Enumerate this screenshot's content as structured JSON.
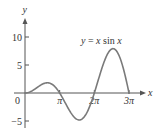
{
  "chart_data": {
    "type": "line",
    "title": "",
    "annotation": "y = x sin x",
    "annotation_parts": {
      "lhs": "y",
      "eq": " = ",
      "x": "x",
      "fn": " sin ",
      "arg": "x"
    },
    "xlabel": "x",
    "ylabel": "y",
    "xlim": [
      0,
      9.8
    ],
    "ylim": [
      -6,
      12.9
    ],
    "grid": false,
    "legend": "none",
    "x_ticks": [
      {
        "value": 3.14159,
        "label": "π"
      },
      {
        "value": 6.28319,
        "label": "2π"
      },
      {
        "value": 9.42478,
        "label": "3π"
      }
    ],
    "y_ticks": [
      {
        "value": 10,
        "label": "10"
      },
      {
        "value": 5,
        "label": "5"
      },
      {
        "value": -5,
        "label": "−5"
      }
    ],
    "origin_label": "0",
    "series": [
      {
        "name": "y = x sin x",
        "function": "x*sin(x)",
        "domain": [
          0,
          9.42478
        ],
        "x": [
          0,
          0.5,
          1.0,
          1.5,
          2.0,
          2.03,
          2.5,
          3.0,
          3.14159,
          3.5,
          4.0,
          4.5,
          4.91,
          5.5,
          6.0,
          6.28319,
          6.5,
          7.0,
          7.5,
          7.98,
          8.5,
          9.0,
          9.42478
        ],
        "y": [
          0,
          0.24,
          0.84,
          1.5,
          1.82,
          1.82,
          1.5,
          0.42,
          0,
          -1.23,
          -3.03,
          -4.4,
          -4.81,
          -3.87,
          -1.68,
          0,
          1.41,
          4.6,
          7.04,
          7.92,
          6.8,
          3.71,
          0
        ]
      }
    ],
    "key_points": {
      "local_max_1": {
        "x": 2.03,
        "y": 1.82
      },
      "local_min": {
        "x": 4.91,
        "y": -4.81
      },
      "local_max_2": {
        "x": 7.98,
        "y": 7.92
      },
      "zeros": [
        0,
        3.14159,
        6.28319,
        9.42478
      ]
    }
  }
}
